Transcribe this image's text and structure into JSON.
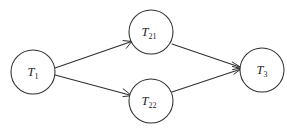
{
  "diagram": {
    "type": "directed-graph",
    "background_color": "#ffffff",
    "stroke_color": "#2f2f2f",
    "label_color": "#1e1e1e",
    "nodes": [
      {
        "id": "T1",
        "base": "T",
        "sub": "1",
        "label": "T1",
        "cx": 33,
        "cy": 72,
        "r": 22
      },
      {
        "id": "T21",
        "base": "T",
        "sub": "21",
        "label": "T21",
        "cx": 151,
        "cy": 32,
        "r": 22
      },
      {
        "id": "T22",
        "base": "T",
        "sub": "22",
        "label": "T22",
        "cx": 151,
        "cy": 101,
        "r": 22
      },
      {
        "id": "T3",
        "base": "T",
        "sub": "3",
        "label": "T3",
        "cx": 262,
        "cy": 70,
        "r": 22
      }
    ],
    "edges": [
      {
        "id": "e1",
        "from": "T1",
        "to": "T21",
        "x1": 55,
        "y1": 68,
        "x2": 131,
        "y2": 42,
        "directed": true
      },
      {
        "id": "e2",
        "from": "T1",
        "to": "T22",
        "x1": 55,
        "y1": 75,
        "x2": 131,
        "y2": 95,
        "directed": true
      },
      {
        "id": "e3",
        "from": "T21",
        "to": "T3",
        "x1": 172,
        "y1": 44,
        "x2": 241,
        "y2": 67,
        "directed": true
      },
      {
        "id": "e4",
        "from": "T22",
        "to": "T3",
        "x1": 172,
        "y1": 92,
        "x2": 241,
        "y2": 72,
        "directed": true
      }
    ]
  }
}
